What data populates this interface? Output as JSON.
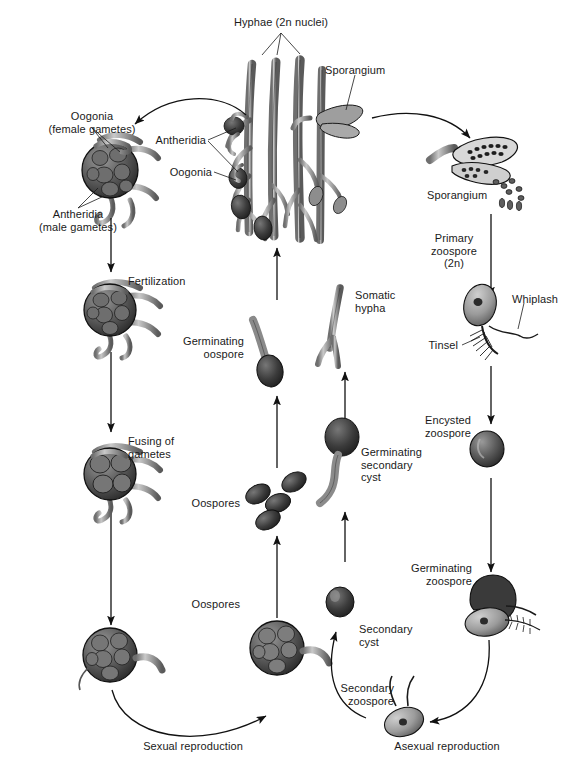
{
  "figure": {
    "background_color": "#ffffff",
    "text_color": "#1a1a1a",
    "structure_fill_light": "#b3b3b3",
    "structure_fill_mid": "#8a8a8a",
    "structure_fill_dark": "#4d4d4d",
    "structure_fill_darkest": "#2e2e2e",
    "outline_color": "#1a1a1a"
  },
  "labels": {
    "hyphae": "Hyphae (2n nuclei)",
    "sporangium_top": "Sporangium",
    "sporangium_right": "Sporangium",
    "antheridia_center": "Antheridia",
    "oogonia_center": "Oogonia",
    "oogonia_female": "Oogonia\n(female gametes)",
    "antheridia_male": "Antheridia\n(male gametes)",
    "fertilization": "Fertilization",
    "fusing_of_gametes": "Fusing of\ngametes",
    "germinating_oospore": "Germinating\noospore",
    "oospores_upper": "Oospores",
    "oospores_lower": "Oospores",
    "somatic_hypha": "Somatic\nhypha",
    "germinating_secondary_cyst": "Germinating\nsecondary\ncyst",
    "secondary_cyst": "Secondary\ncyst",
    "secondary_zoospore": "Secondary\nzoospore",
    "primary_zoospore": "Primary\nzoospore\n(2n)",
    "whiplash": "Whiplash",
    "tinsel": "Tinsel",
    "encysted_zoospore": "Encysted\nzoospore",
    "germinating_zoospore": "Germinating\nzoospore",
    "sexual_reproduction": "Sexual reproduction",
    "asexual_reproduction": "Asexual reproduction"
  },
  "label_lines": {
    "hyphae_lines": "leader lines from Hyphae (2n nuclei) label branching to three hyphal stalks",
    "sporangium_leader": "leader line from Sporangium label to sporangium body",
    "antheridia_leaders": "two leader lines from Antheridia label to antheridial structures",
    "oogonia_leader": "leader line from Oogonia label to oogonium",
    "oogonia_female_leaders": "two leader lines to oogonium in detail view",
    "antheridia_male_leaders": "two leader lines to antheridia in detail view",
    "whiplash_leader": "leader line from Whiplash label to whiplash flagellum",
    "tinsel_leader": "leader line from Tinsel label to tinsel flagellum"
  },
  "icon_names": {
    "arrow_down": "arrow-down-icon",
    "arrow_up": "arrow-up-icon",
    "curved_arrow": "curved-arrow-icon",
    "hyphae": "hyphae-icon",
    "oogonium": "oogonium-icon",
    "oospore": "oospore-icon",
    "zoospore": "zoospore-icon",
    "cyst": "cyst-icon",
    "sporangium": "sporangium-icon"
  },
  "cycle_data": {
    "type": "diagram",
    "sexual_pathway": [
      "Hyphae (2n nuclei)",
      "Oogonia (female gametes) / Antheridia (male gametes)",
      "Fertilization",
      "Fusing of gametes",
      "Oospores",
      "Oospores",
      "Germinating oospore",
      "Hyphae (2n nuclei)"
    ],
    "asexual_pathway": [
      "Hyphae (2n nuclei)",
      "Sporangium",
      "Primary zoospore (2n)",
      "Encysted zoospore",
      "Germinating zoospore",
      "Secondary zoospore",
      "Secondary cyst",
      "Germinating secondary cyst",
      "Somatic hypha"
    ],
    "flagella_types": [
      "Whiplash",
      "Tinsel"
    ]
  }
}
